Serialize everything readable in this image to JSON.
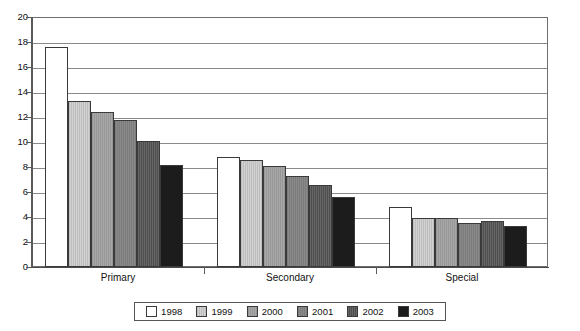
{
  "chart_data": {
    "type": "bar",
    "title": "",
    "subtitle": "",
    "xlabel": "",
    "ylabel": "",
    "ylim": [
      0,
      20
    ],
    "ytick_step": 2,
    "yticks": [
      20,
      18,
      16,
      14,
      12,
      10,
      8,
      6,
      4,
      2,
      0
    ],
    "grid": true,
    "legend_position": "bottom",
    "categories": [
      "Primary",
      "Secondary",
      "Special"
    ],
    "series": [
      {
        "name": "1998",
        "color": "#ffffff",
        "values": [
          17.6,
          8.8,
          4.8
        ]
      },
      {
        "name": "1999",
        "color": "#d2d2d2",
        "values": [
          13.3,
          8.6,
          3.9
        ]
      },
      {
        "name": "2000",
        "color": "#a8a8a8",
        "values": [
          12.4,
          8.1,
          3.9
        ]
      },
      {
        "name": "2001",
        "color": "#8a8a8a",
        "values": [
          11.8,
          7.3,
          3.5
        ]
      },
      {
        "name": "2002",
        "color": "#4e4e4e",
        "values": [
          10.1,
          6.6,
          3.7
        ]
      },
      {
        "name": "2003",
        "color": "#1c1c1c",
        "values": [
          8.2,
          5.6,
          3.3
        ]
      }
    ]
  },
  "legend": {
    "items": [
      {
        "label": "1998"
      },
      {
        "label": "1999"
      },
      {
        "label": "2000"
      },
      {
        "label": "2001"
      },
      {
        "label": "2002"
      },
      {
        "label": "2003"
      }
    ]
  }
}
